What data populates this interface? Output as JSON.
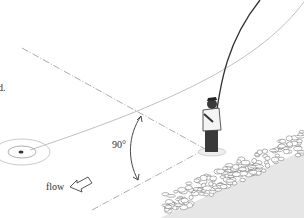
{
  "figure": {
    "labels": {
      "fragment": "d.",
      "angle": "90°",
      "flow": "flow"
    },
    "icons": {
      "flow_arrow": "hollow-arrow-left-down",
      "target": "concentric-rings"
    },
    "colors": {
      "line": "#9a9a9a",
      "dark": "#2b2b2b",
      "rock": "#8a8a8a",
      "bank": "#d8d8d8"
    }
  }
}
